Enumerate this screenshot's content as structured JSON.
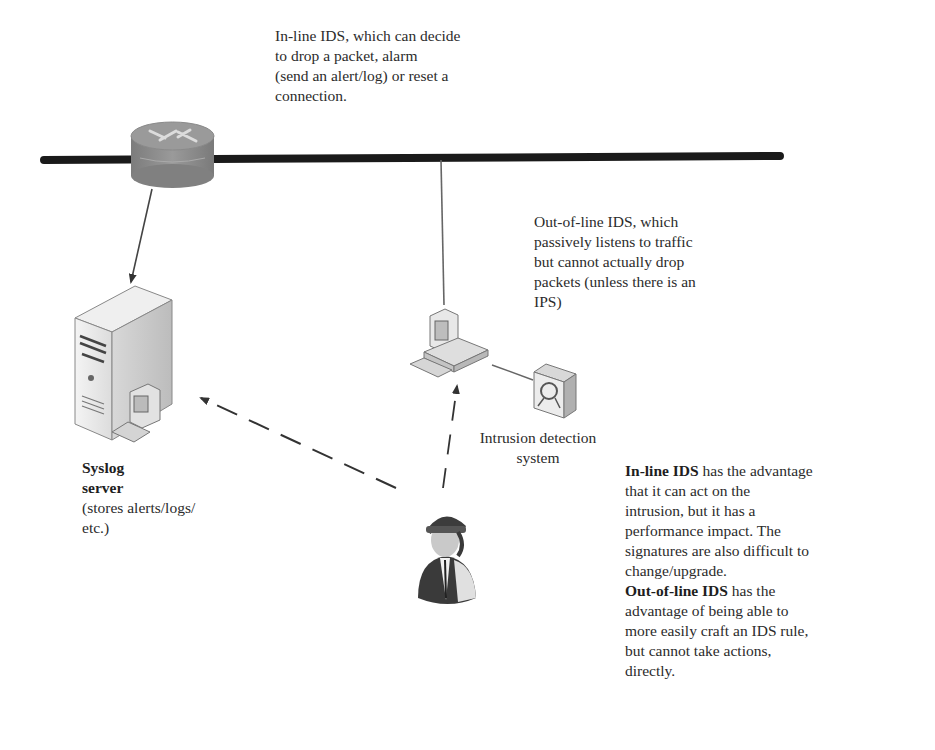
{
  "labels": {
    "inline_ids_note": "In-line IDS, which can decide to drop a packet, alarm (send an alert/log) or reset a connection.",
    "inline_ids_lines": [
      "In-line IDS, which can decide",
      "to drop a packet, alarm",
      "(send an alert/log) or reset a",
      "connection."
    ],
    "outofline_ids_lines": [
      "Out-of-line IDS, which",
      "passively listens to traffic",
      "but cannot actually drop",
      "packets (unless there is an",
      "IPS)"
    ],
    "ids_caption_lines": [
      "Intrusion detection",
      "system"
    ],
    "syslog_title_lines": [
      "Syslog",
      "server"
    ],
    "syslog_desc_lines": [
      "(stores alerts/logs/",
      "etc.)"
    ],
    "comparison": {
      "inline_heading": "In-line IDS",
      "inline_text_first": " has the advantage",
      "inline_text_lines": [
        "that it can act on the",
        "intrusion, but it has a",
        "performance impact. The",
        "signatures are also difficult to",
        "change/upgrade."
      ],
      "outofline_heading": "Out-of-line IDS",
      "outofline_text_first": " has the",
      "outofline_text_lines": [
        "advantage of being able to",
        "more easily craft an IDS rule,",
        "but cannot take actions,",
        "directly."
      ]
    }
  },
  "nodes": [
    {
      "id": "router",
      "icon": "router-icon"
    },
    {
      "id": "syslog-server",
      "icon": "server-icon"
    },
    {
      "id": "ids-workstation",
      "icon": "workstation-icon"
    },
    {
      "id": "ids-sensor",
      "icon": "sensor-icon"
    },
    {
      "id": "admin",
      "icon": "person-icon"
    }
  ],
  "edges": [
    {
      "from": "router",
      "to": "network-bus",
      "style": "solid"
    },
    {
      "from": "router",
      "to": "syslog-server",
      "style": "solid-arrow"
    },
    {
      "from": "network-bus",
      "to": "ids-workstation",
      "style": "solid"
    },
    {
      "from": "ids-workstation",
      "to": "ids-sensor",
      "style": "solid"
    },
    {
      "from": "admin",
      "to": "syslog-server",
      "style": "dashed-arrow"
    },
    {
      "from": "admin",
      "to": "ids-workstation",
      "style": "dashed-arrow"
    }
  ],
  "colors": {
    "bus": "#1a1a1a",
    "router": "#8a8a8a",
    "line": "#555555",
    "device_light": "#e6e6e6",
    "device_mid": "#c8c8c8",
    "device_dark": "#9a9a9a"
  }
}
